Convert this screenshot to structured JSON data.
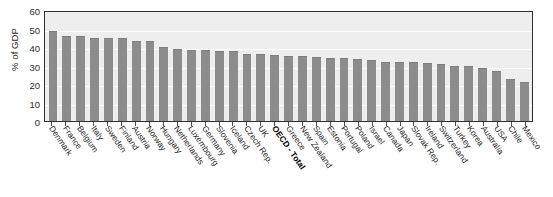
{
  "chart_data": {
    "type": "bar",
    "title": "",
    "subtitle": "",
    "xlabel": "",
    "ylabel": "% of GDP",
    "ylim": [
      0,
      60
    ],
    "yticks": [
      0,
      10,
      20,
      30,
      40,
      50,
      60
    ],
    "grid": true,
    "legend": null,
    "bar_color": "#8c8c8c",
    "plot_bg": "#eeeeee",
    "highlight_category": "OECD - Total",
    "categories": [
      "Denmark",
      "France",
      "Belgium",
      "Italy",
      "Sweden",
      "Finland",
      "Austria",
      "Norway",
      "Hungary",
      "Netherlands",
      "Luxembourg",
      "Germany",
      "Slovenia",
      "Iceland",
      "Czech Rep.",
      "UK",
      "OECD - Total",
      "Greece",
      "New Zealand",
      "Spain",
      "Estonia",
      "Portugal",
      "Poland",
      "Israel",
      "Canada",
      "Japan",
      "Slovak Rep.",
      "Ireland",
      "Switzerland",
      "Turkey",
      "Korea",
      "Australia",
      "USA",
      "Chile",
      "Mexico"
    ],
    "values": [
      48.5,
      46.0,
      45.8,
      45.0,
      45.0,
      44.8,
      43.5,
      43.0,
      40.0,
      39.0,
      38.5,
      38.5,
      38.0,
      37.8,
      36.0,
      36.0,
      35.5,
      35.0,
      35.0,
      34.5,
      34.0,
      34.0,
      33.5,
      33.0,
      32.0,
      32.0,
      32.0,
      31.5,
      31.0,
      30.0,
      29.5,
      28.5,
      27.0,
      22.5,
      21.0
    ]
  }
}
